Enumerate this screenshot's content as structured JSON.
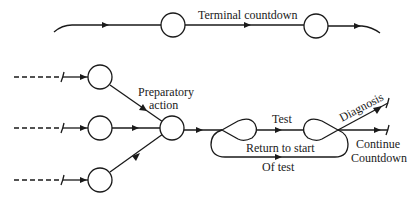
{
  "diagram": {
    "type": "flow-network",
    "labels": {
      "terminal_countdown": "Terminal countdown",
      "preparatory_line1": "Preparatory",
      "preparatory_line2": "action",
      "test": "Test",
      "diagnosis": "Diagnosis",
      "return_to_start": "Return to start",
      "of_test": "Of test",
      "continue": "Continue",
      "countdown": "Countdown"
    },
    "nodes": [
      {
        "id": "terminal-1",
        "kind": "circle"
      },
      {
        "id": "terminal-2",
        "kind": "circle"
      },
      {
        "id": "input-top",
        "kind": "circle"
      },
      {
        "id": "input-middle",
        "kind": "circle"
      },
      {
        "id": "input-bottom",
        "kind": "circle"
      },
      {
        "id": "merge",
        "kind": "circle"
      },
      {
        "id": "test-start",
        "kind": "loop-node"
      },
      {
        "id": "test-end",
        "kind": "loop-node"
      }
    ],
    "edges": [
      {
        "from": "start",
        "to": "terminal-1"
      },
      {
        "from": "terminal-1",
        "to": "terminal-2",
        "label": "Terminal countdown"
      },
      {
        "from": "terminal-2",
        "to": "end"
      },
      {
        "from": "input-top",
        "to": "merge"
      },
      {
        "from": "input-middle",
        "to": "merge"
      },
      {
        "from": "input-bottom",
        "to": "merge"
      },
      {
        "from": "merge",
        "to": "test-start"
      },
      {
        "from": "test-start",
        "to": "test-end",
        "label": "Test"
      },
      {
        "from": "test-end",
        "to": "test-start",
        "label": "Return to start Of test"
      },
      {
        "from": "test-end",
        "to": "diagnosis",
        "label": "Diagnosis"
      },
      {
        "from": "test-end",
        "to": "continue",
        "label": "Continue Countdown"
      }
    ]
  }
}
